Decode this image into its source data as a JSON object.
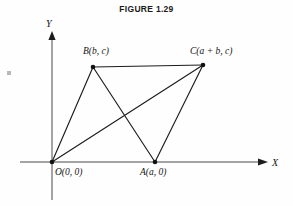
{
  "figure": {
    "title": "FIGURE 1.29",
    "caption_position": "top-center"
  },
  "axes": {
    "x_label": "X",
    "y_label": "Y",
    "x_axis_name": "horizontal-axis",
    "y_axis_name": "vertical-axis",
    "x_arrow_icon": "arrow-right-icon",
    "y_arrow_icon": "arrow-up-icon"
  },
  "colors": {
    "background": "#fefefe",
    "ink": "#1c1c1c",
    "axis": "#4a4a4a",
    "title": "#1a1a1a"
  },
  "vertices": [
    {
      "id": "O",
      "label": "O(0, 0)",
      "x": 0,
      "y": 0,
      "px": 52,
      "py": 162,
      "label_px": 55,
      "label_py": 175
    },
    {
      "id": "A",
      "label": "A(a, 0)",
      "x": "a",
      "y": 0,
      "px": 155,
      "py": 162,
      "label_px": 140,
      "label_py": 175
    },
    {
      "id": "B",
      "label": "B(b, c)",
      "x": "b",
      "y": "c",
      "px": 93,
      "py": 67,
      "label_px": 83,
      "label_py": 54
    },
    {
      "id": "C",
      "label": "C(a + b, c)",
      "x": "a + b",
      "y": "c",
      "px": 203,
      "py": 65,
      "label_px": 190,
      "label_py": 54
    }
  ],
  "edges": [
    {
      "name": "side-OB",
      "from": "O",
      "to": "B"
    },
    {
      "name": "side-BC",
      "from": "B",
      "to": "C"
    },
    {
      "name": "side-AC",
      "from": "A",
      "to": "C"
    },
    {
      "name": "diagonal-OC",
      "from": "O",
      "to": "C"
    },
    {
      "name": "diagonal-BA",
      "from": "B",
      "to": "A"
    }
  ],
  "shape": {
    "name": "parallelogram-OACB",
    "description": "Parallelogram with vertices O, A, C, B and both diagonals drawn"
  }
}
